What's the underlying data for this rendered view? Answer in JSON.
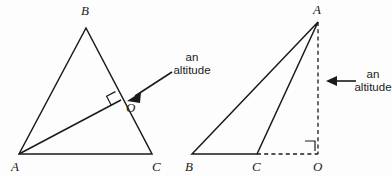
{
  "figure": {
    "background_color": "#fdfdfd",
    "ink_color": "#1a1a1a",
    "width": 392,
    "height": 176
  },
  "left_figure": {
    "name": "acute-triangle-with-interior-altitude",
    "vertices": {
      "A": "A",
      "B": "B",
      "C": "C",
      "O": "O"
    },
    "callout": {
      "line1": "an",
      "line2": "altitude"
    }
  },
  "right_figure": {
    "name": "obtuse-triangle-with-exterior-altitude",
    "vertices": {
      "A": "A",
      "B": "B",
      "C": "C",
      "O": "O"
    },
    "callout": {
      "line1": "an",
      "line2": "altitude"
    }
  }
}
